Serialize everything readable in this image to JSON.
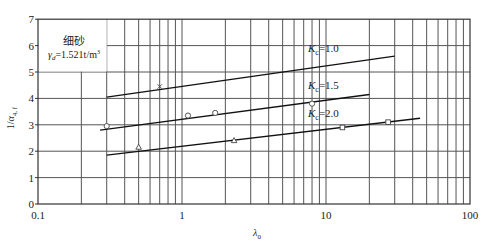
{
  "chart_data": {
    "type": "line",
    "title": "",
    "xlabel": "λ0",
    "ylabel": "1/α4,f",
    "xscale": "log",
    "xlim": [
      0.1,
      100
    ],
    "ylim": [
      0,
      7
    ],
    "grid": true,
    "xticks": [
      {
        "value": 0.1,
        "label": "0.1"
      },
      {
        "value": 1,
        "label": "1"
      },
      {
        "value": 10,
        "label": "10"
      },
      {
        "value": 100,
        "label": "100"
      }
    ],
    "yticks": [
      {
        "value": 0,
        "label": "0"
      },
      {
        "value": 1,
        "label": "1"
      },
      {
        "value": 2,
        "label": "2"
      },
      {
        "value": 3,
        "label": "3"
      },
      {
        "value": 4,
        "label": "4"
      },
      {
        "value": 5,
        "label": "5"
      },
      {
        "value": 6,
        "label": "6"
      },
      {
        "value": 7,
        "label": "7"
      }
    ],
    "annotation": {
      "line1": "细砂",
      "line2_prefix": "γ",
      "line2_sub": "d",
      "line2_rest": "=1.521t/m",
      "line2_sup": "3",
      "box": {
        "x0": 0.1,
        "x1": 0.3,
        "y0": 5,
        "y1": 7
      }
    },
    "series": [
      {
        "name": "Kc=1.0",
        "label_main": "K",
        "label_sub": "c",
        "label_val": "=1.0",
        "label_pos": {
          "x": 7.5,
          "y": 5.75
        },
        "fit_line": [
          [
            0.3,
            4.05
          ],
          [
            30,
            5.6
          ]
        ],
        "marker": "x",
        "points": [
          [
            0.7,
            4.45
          ]
        ]
      },
      {
        "name": "Kc=1.5",
        "label_main": "K",
        "label_sub": "c",
        "label_val": "=1.5",
        "label_pos": {
          "x": 7.5,
          "y": 4.35
        },
        "fit_line": [
          [
            0.27,
            2.8
          ],
          [
            20,
            4.15
          ]
        ],
        "marker": "circle",
        "points": [
          [
            0.3,
            2.95
          ],
          [
            1.1,
            3.35
          ],
          [
            1.7,
            3.45
          ],
          [
            8,
            3.8
          ]
        ]
      },
      {
        "name": "Kc=2.0",
        "label_main": "K",
        "label_sub": "c",
        "label_val": "=2.0",
        "label_pos": {
          "x": 7.5,
          "y": 3.3
        },
        "fit_line": [
          [
            0.3,
            1.85
          ],
          [
            45,
            3.25
          ]
        ],
        "markers": [
          "triangle",
          "triangle",
          "square",
          "square"
        ],
        "points": [
          [
            0.5,
            2.15
          ],
          [
            2.3,
            2.4
          ],
          [
            13,
            2.9
          ],
          [
            27,
            3.1
          ]
        ]
      }
    ]
  },
  "colors": {
    "axis": "#333333",
    "grid": "#555555",
    "line": "#111111",
    "marker": "#444444",
    "text": "#222222"
  }
}
